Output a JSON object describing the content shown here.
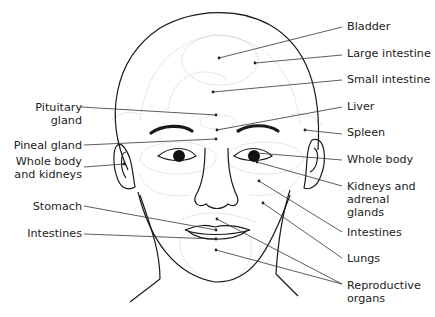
{
  "diagram": {
    "labels_left": [
      {
        "id": "pituitary",
        "text": [
          "Pituitary",
          "gland"
        ]
      },
      {
        "id": "pineal",
        "text": [
          "Pineal gland"
        ]
      },
      {
        "id": "whole-body-kidneys",
        "text": [
          "Whole body",
          "and kidneys"
        ]
      },
      {
        "id": "stomach",
        "text": [
          "Stomach"
        ]
      },
      {
        "id": "intestines-left",
        "text": [
          "Intestines"
        ]
      }
    ],
    "labels_right": [
      {
        "id": "bladder",
        "text": [
          "Bladder"
        ]
      },
      {
        "id": "large-intestine",
        "text": [
          "Large intestine"
        ]
      },
      {
        "id": "small-intestine",
        "text": [
          "Small intestine"
        ]
      },
      {
        "id": "liver",
        "text": [
          "Liver"
        ]
      },
      {
        "id": "spleen",
        "text": [
          "Spleen"
        ]
      },
      {
        "id": "whole-body",
        "text": [
          "Whole body"
        ]
      },
      {
        "id": "kidneys-adrenal",
        "text": [
          "Kidneys and",
          "adrenal",
          "glands"
        ]
      },
      {
        "id": "intestines-right",
        "text": [
          "Intestines"
        ]
      },
      {
        "id": "lungs",
        "text": [
          "Lungs"
        ]
      },
      {
        "id": "reproductive",
        "text": [
          "Reproductive",
          "organs"
        ]
      }
    ]
  }
}
